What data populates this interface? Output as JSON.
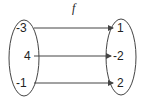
{
  "diagram": {
    "function_label": "f",
    "domain": [
      "-3",
      "4",
      "-1"
    ],
    "codomain": [
      "1",
      "-2",
      "2"
    ],
    "mappings": [
      {
        "from": "-3",
        "to": "1"
      },
      {
        "from": "4",
        "to": "-2"
      },
      {
        "from": "-1",
        "to": "2"
      }
    ],
    "colors": {
      "stroke": "#444444",
      "text": "#222222"
    }
  }
}
